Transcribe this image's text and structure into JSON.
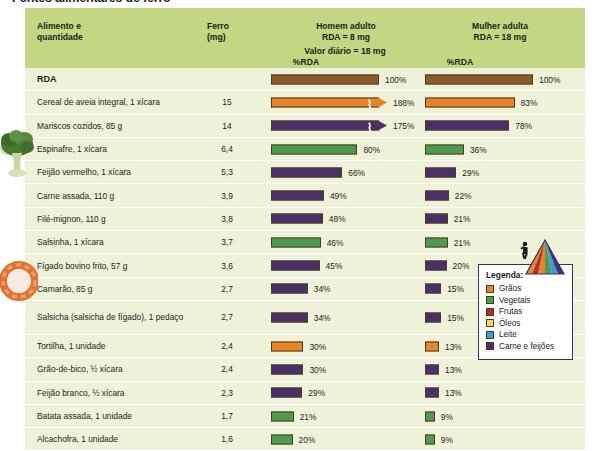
{
  "title": "Fontes alimentares de ferro",
  "header": {
    "food_col": "Alimento e\nquantidade",
    "food_col_line1": "Alimento e",
    "food_col_line2": "quantidade",
    "iron_col_line1": "Ferro",
    "iron_col_line2": "(mg)",
    "man_line1": "Homem adulto",
    "man_line2": "RDA = 8 mg",
    "woman_line1": "Mulher adulta",
    "woman_line2": "RDA = 18 mg",
    "daily_value": "Valor diário = 18 mg",
    "pct_man": "%RDA",
    "pct_woman": "%RDA"
  },
  "colors": {
    "header_band": "#c3d782",
    "row_bg": "#eef2d8",
    "row_divider": "#ffffff",
    "graos": "#e8832a",
    "vegetais": "#4e9a4e",
    "frutas": "#b5301f",
    "oleos": "#f2e14c",
    "leite": "#2aa3e0",
    "carne_feijoes": "#4a2f6b",
    "rda_brown": "#8c5a2b",
    "legend_border": "#3a2f6b",
    "text": "#1d1d1b"
  },
  "legend": {
    "title": "Legenda:",
    "items": [
      {
        "label": "Grãos",
        "color": "#e8832a"
      },
      {
        "label": "Vegetais",
        "color": "#4e9a4e"
      },
      {
        "label": "Frutas",
        "color": "#b5301f"
      },
      {
        "label": "Óleos",
        "color": "#f2e14c"
      },
      {
        "label": "Leite",
        "color": "#2aa3e0"
      },
      {
        "label": "Carne e feijões",
        "color": "#4a2f6b"
      }
    ]
  },
  "chart_data": {
    "type": "bar",
    "title": "Fontes alimentares de ferro",
    "xlabel": "%RDA",
    "ylabel": "Alimento e quantidade",
    "xlim": [
      0,
      100
    ],
    "grid": false,
    "legend_position": "bottom-right",
    "categories": [
      "RDA",
      "Cereal de aveia integral, 1 xícara",
      "Mariscos cozidos, 85 g",
      "Espinafre, 1 xícara",
      "Feijão vermelho, 1 xícara",
      "Carne assada, 110 g",
      "Filé-mignon, 110 g",
      "Salsinha, 1 xícara",
      "Fígado bovino frito, 57 g",
      "Camarão, 85 g",
      "Salsicha (salsicha de fígado), 1 pedaço",
      "Tortilha, 1 unidade",
      "Grão-de-bico, ½ xícara",
      "Feijão branco, ½ xícara",
      "Batata assada, 1 unidade",
      "Alcachofra, 1 unidade"
    ],
    "series": [
      {
        "name": "Homem adulto %RDA (RDA = 8 mg)",
        "values": [
          100,
          188,
          175,
          80,
          66,
          49,
          48,
          46,
          45,
          34,
          34,
          30,
          30,
          29,
          21,
          20
        ]
      },
      {
        "name": "Mulher adulta %RDA (RDA = 18 mg)",
        "values": [
          100,
          83,
          78,
          36,
          29,
          22,
          21,
          21,
          20,
          15,
          15,
          13,
          13,
          13,
          9,
          9
        ]
      }
    ],
    "iron_mg": [
      null,
      15,
      14,
      6.4,
      5.3,
      3.9,
      3.8,
      3.7,
      3.6,
      2.7,
      2.7,
      2.4,
      2.4,
      2.3,
      1.7,
      1.6
    ]
  },
  "rows": [
    {
      "food": "RDA",
      "iron": "",
      "bold": true,
      "tall": false,
      "group": "rda",
      "color": "#8c5a2b",
      "man": {
        "pct": "100%",
        "value": 100,
        "broken": false
      },
      "woman": {
        "pct": "100%",
        "value": 100,
        "broken": false
      }
    },
    {
      "food": "Cereal de aveia integral, 1 xícara",
      "iron": "15",
      "bold": false,
      "tall": false,
      "group": "graos",
      "color": "#e8832a",
      "man": {
        "pct": "188%",
        "value": 188,
        "broken": true
      },
      "woman": {
        "pct": "83%",
        "value": 83,
        "broken": false
      }
    },
    {
      "food": "Mariscos cozidos, 85 g",
      "iron": "14",
      "bold": false,
      "tall": false,
      "group": "carne",
      "color": "#4a2f6b",
      "man": {
        "pct": "175%",
        "value": 175,
        "broken": true
      },
      "woman": {
        "pct": "78%",
        "value": 78,
        "broken": false
      }
    },
    {
      "food": "Espinafre, 1 xícara",
      "iron": "6,4",
      "bold": false,
      "tall": false,
      "group": "vegetais",
      "color": "#4e9a4e",
      "man": {
        "pct": "80%",
        "value": 80,
        "broken": false
      },
      "woman": {
        "pct": "36%",
        "value": 36,
        "broken": false
      }
    },
    {
      "food": "Feijão vermelho, 1 xícara",
      "iron": "5,3",
      "bold": false,
      "tall": false,
      "group": "carne",
      "color": "#4a2f6b",
      "man": {
        "pct": "66%",
        "value": 66,
        "broken": false
      },
      "woman": {
        "pct": "29%",
        "value": 29,
        "broken": false
      }
    },
    {
      "food": "Carne assada, 110 g",
      "iron": "3,9",
      "bold": false,
      "tall": false,
      "group": "carne",
      "color": "#4a2f6b",
      "man": {
        "pct": "49%",
        "value": 49,
        "broken": false
      },
      "woman": {
        "pct": "22%",
        "value": 22,
        "broken": false
      }
    },
    {
      "food": "Filé-mignon, 110 g",
      "iron": "3,8",
      "bold": false,
      "tall": false,
      "group": "carne",
      "color": "#4a2f6b",
      "man": {
        "pct": "48%",
        "value": 48,
        "broken": false
      },
      "woman": {
        "pct": "21%",
        "value": 21,
        "broken": false
      }
    },
    {
      "food": "Salsinha, 1 xícara",
      "iron": "3,7",
      "bold": false,
      "tall": false,
      "group": "vegetais",
      "color": "#4e9a4e",
      "man": {
        "pct": "46%",
        "value": 46,
        "broken": false
      },
      "woman": {
        "pct": "21%",
        "value": 21,
        "broken": false
      }
    },
    {
      "food": "Fígado bovino frito, 57 g",
      "iron": "3,6",
      "bold": false,
      "tall": false,
      "group": "carne",
      "color": "#4a2f6b",
      "man": {
        "pct": "45%",
        "value": 45,
        "broken": false
      },
      "woman": {
        "pct": "20%",
        "value": 20,
        "broken": false
      }
    },
    {
      "food": "Camarão, 85 g",
      "iron": "2,7",
      "bold": false,
      "tall": false,
      "group": "carne",
      "color": "#4a2f6b",
      "man": {
        "pct": "34%",
        "value": 34,
        "broken": false
      },
      "woman": {
        "pct": "15%",
        "value": 15,
        "broken": false
      }
    },
    {
      "food": "Salsicha (salsicha de fígado), 1 pedaço",
      "iron": "2,7",
      "bold": false,
      "tall": true,
      "group": "carne",
      "color": "#4a2f6b",
      "man": {
        "pct": "34%",
        "value": 34,
        "broken": false
      },
      "woman": {
        "pct": "15%",
        "value": 15,
        "broken": false
      }
    },
    {
      "food": "Tortilha, 1 unidade",
      "iron": "2,4",
      "bold": false,
      "tall": false,
      "group": "graos",
      "color": "#e8832a",
      "man": {
        "pct": "30%",
        "value": 30,
        "broken": false
      },
      "woman": {
        "pct": "13%",
        "value": 13,
        "broken": false
      }
    },
    {
      "food": "Grão-de-bico, ½ xícara",
      "iron": "2,4",
      "bold": false,
      "tall": false,
      "group": "carne",
      "color": "#4a2f6b",
      "man": {
        "pct": "30%",
        "value": 30,
        "broken": false
      },
      "woman": {
        "pct": "13%",
        "value": 13,
        "broken": false
      }
    },
    {
      "food": "Feijão branco, ½ xícara",
      "iron": "2,3",
      "bold": false,
      "tall": false,
      "group": "carne",
      "color": "#4a2f6b",
      "man": {
        "pct": "29%",
        "value": 29,
        "broken": false
      },
      "woman": {
        "pct": "13%",
        "value": 13,
        "broken": false
      }
    },
    {
      "food": "Batata assada, 1 unidade",
      "iron": "1,7",
      "bold": false,
      "tall": false,
      "group": "vegetais",
      "color": "#4e9a4e",
      "man": {
        "pct": "21%",
        "value": 21,
        "broken": false
      },
      "woman": {
        "pct": "9%",
        "value": 9,
        "broken": false
      }
    },
    {
      "food": "Alcachofra, 1 unidade",
      "iron": "1,6",
      "bold": false,
      "tall": false,
      "group": "vegetais",
      "color": "#4e9a4e",
      "man": {
        "pct": "20%",
        "value": 20,
        "broken": false
      },
      "woman": {
        "pct": "9%",
        "value": 9,
        "broken": false
      }
    }
  ],
  "decorations": {
    "pyramid_icon": "food-pyramid-icon",
    "photo_broccoli": "broccoli-photo",
    "photo_shrimp": "shrimp-photo"
  }
}
